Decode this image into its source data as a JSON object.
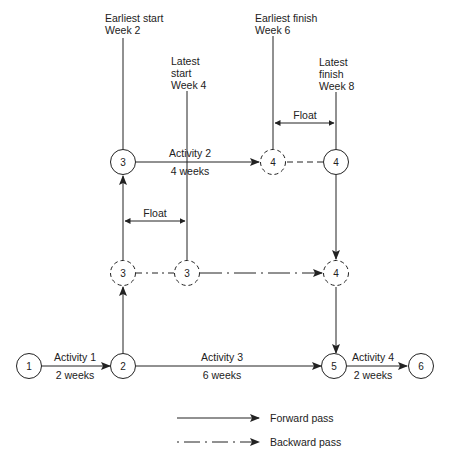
{
  "annotations": {
    "earliest_start": [
      "Earliest start",
      "Week 2"
    ],
    "latest_start": [
      "Latest",
      "start",
      "Week 4"
    ],
    "earliest_finish": [
      "Earliest finish",
      "Week 6"
    ],
    "latest_finish": [
      "Latest",
      "finish",
      "Week 8"
    ],
    "float_top": "Float",
    "float_mid": "Float"
  },
  "nodes": {
    "n1": "1",
    "n2": "2",
    "n3_top": "3",
    "n4_dashed_top": "4",
    "n4_top": "4",
    "n3_dashed_left": "3",
    "n3_dashed_right": "3",
    "n4_dashed_mid": "4",
    "n5": "5",
    "n6": "6"
  },
  "activities": [
    {
      "name": "Activity 1",
      "duration": "2 weeks"
    },
    {
      "name": "Activity 2",
      "duration": "4 weeks"
    },
    {
      "name": "Activity 3",
      "duration": "6 weeks"
    },
    {
      "name": "Activity 4",
      "duration": "2 weeks"
    }
  ],
  "legend": {
    "forward": "Forward pass",
    "backward": "Backward pass"
  },
  "colors": {
    "stroke": "#222222"
  }
}
